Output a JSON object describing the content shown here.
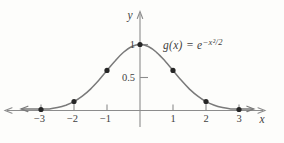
{
  "labels": {
    "y_axis": "y",
    "x_axis": "x",
    "function_base": "g(x) = e",
    "function_exponent": "−x²/2"
  },
  "colors": {
    "background": "#fdfdfb",
    "axis": "#8c8c8c",
    "curve": "#7a7a7a",
    "dot": "#262626",
    "text": "#3f3f3f"
  },
  "chart_data": {
    "type": "line",
    "title": "",
    "function": "g(x) = e^(-x^2/2)",
    "xlabel": "x",
    "ylabel": "y",
    "grid": false,
    "legend": "none",
    "xlim": [
      -4.1,
      3.8
    ],
    "ylim": [
      0,
      1.5
    ],
    "x_ticks": [
      -3,
      -2,
      -1,
      1,
      2,
      3
    ],
    "x_tick_labels": [
      "−3",
      "−2",
      "−1",
      "1",
      "2",
      "3"
    ],
    "y_ticks": [
      0.5,
      1
    ],
    "y_tick_labels": [
      "0.5",
      "1"
    ],
    "marked_points": [
      [
        -3,
        0.0111
      ],
      [
        -2,
        0.1353
      ],
      [
        -1,
        0.6065
      ],
      [
        0,
        1.0
      ],
      [
        1,
        0.6065
      ],
      [
        2,
        0.1353
      ],
      [
        3,
        0.0111
      ]
    ],
    "curve_points": [
      [
        -3.58,
        0.0016
      ],
      [
        -3.25,
        0.0051
      ],
      [
        -3.0,
        0.0111
      ],
      [
        -2.75,
        0.0228
      ],
      [
        -2.5,
        0.0439
      ],
      [
        -2.25,
        0.0795
      ],
      [
        -2.0,
        0.1353
      ],
      [
        -1.75,
        0.2163
      ],
      [
        -1.5,
        0.3247
      ],
      [
        -1.25,
        0.4578
      ],
      [
        -1.0,
        0.6065
      ],
      [
        -0.75,
        0.7548
      ],
      [
        -0.5,
        0.8825
      ],
      [
        -0.25,
        0.9692
      ],
      [
        0.0,
        1.0
      ],
      [
        0.25,
        0.9692
      ],
      [
        0.5,
        0.8825
      ],
      [
        0.75,
        0.7548
      ],
      [
        1.0,
        0.6065
      ],
      [
        1.25,
        0.4578
      ],
      [
        1.5,
        0.3247
      ],
      [
        1.75,
        0.2163
      ],
      [
        2.0,
        0.1353
      ],
      [
        2.25,
        0.0795
      ],
      [
        2.5,
        0.0439
      ],
      [
        2.75,
        0.0228
      ],
      [
        3.0,
        0.0111
      ],
      [
        3.25,
        0.0051
      ],
      [
        3.42,
        0.0029
      ]
    ]
  }
}
